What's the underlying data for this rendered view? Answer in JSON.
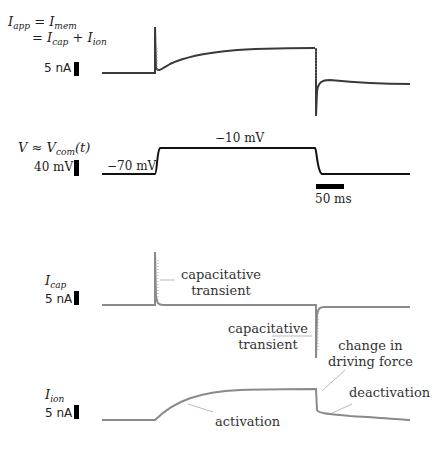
{
  "panels": {
    "membrane_current": {
      "equation_line1_lhs": "I",
      "equation_line1_lhs_sub": "app",
      "equation_line1_eq": "=",
      "equation_line1_rhs": "I",
      "equation_line1_rhs_sub": "mem",
      "equation_line2_eq": "=",
      "equation_line2_a": "I",
      "equation_line2_a_sub": "cap",
      "equation_line2_plus": "+",
      "equation_line2_b": "I",
      "equation_line2_b_sub": "ion",
      "scale_label": "5 nA",
      "trace_color": "#3a3a3a"
    },
    "voltage": {
      "label": "V ≈ V",
      "label_sub": "com",
      "label_suffix": "(t)",
      "scale_label": "40 mV",
      "holding_label": "−70 mV",
      "step_label": "−10 mV",
      "time_scale_label": "50 ms",
      "trace_color": "#111111"
    },
    "capacitive_current": {
      "label": "I",
      "label_sub": "cap",
      "scale_label": "5 nA",
      "annotation_on": "capacitative\ntransient",
      "annotation_off": "capacitative\ntransient",
      "trace_color": "#8a8a8a"
    },
    "ionic_current": {
      "label": "I",
      "label_sub": "ion",
      "scale_label": "5 nA",
      "annotation_activation": "activation",
      "annotation_driving_force": "change in\ndriving force",
      "annotation_deactivation": "deactivation",
      "trace_color": "#8a8a8a"
    }
  }
}
